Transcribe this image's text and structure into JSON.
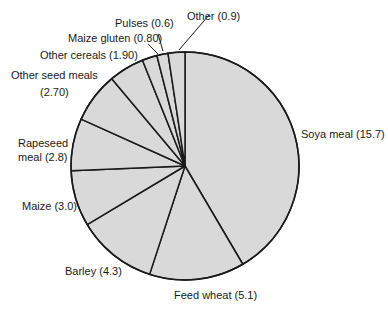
{
  "chart_data": {
    "type": "pie",
    "title": "",
    "start_angle_deg": 0,
    "direction": "clockwise",
    "fill_color": "#d9d9d9",
    "stroke_color": "#1a1a1a",
    "slices": [
      {
        "label": "Soya meal",
        "value": 15.7,
        "display": "Soya meal (15.7)"
      },
      {
        "label": "Feed wheat",
        "value": 5.1,
        "display": "Feed wheat (5.1)"
      },
      {
        "label": "Barley",
        "value": 4.3,
        "display": "Barley (4.3)"
      },
      {
        "label": "Maize",
        "value": 3.0,
        "display": "Maize (3.0)"
      },
      {
        "label": "Rapeseed meal",
        "value": 2.8,
        "display": "Rapeseed meal (2.8)"
      },
      {
        "label": "Other seed meals",
        "value": 2.7,
        "display": "Other seed meals (2.70)"
      },
      {
        "label": "Other cereals",
        "value": 1.9,
        "display": "Other cereals (1.90)"
      },
      {
        "label": "Maize gluten",
        "value": 0.8,
        "display": "Maize gluten (0.80)"
      },
      {
        "label": "Pulses",
        "value": 0.6,
        "display": "Pulses (0.6)"
      },
      {
        "label": "Other",
        "value": 0.9,
        "display": "Other (0.9)"
      }
    ]
  },
  "labels": {
    "soya": "Soya meal (15.7)",
    "feed_wheat": "Feed wheat (5.1)",
    "barley": "Barley (4.3)",
    "maize": "Maize (3.0)",
    "rapeseed_line1": "Rapeseed",
    "rapeseed_line2": "meal (2.8)",
    "other_seed_line1": "Other seed meals",
    "other_seed_line2": "(2.70)",
    "other_cereals": "Other cereals (1.90)",
    "maize_gluten": "Maize gluten (0.80)",
    "pulses": "Pulses (0.6)",
    "other": "Other (0.9)"
  }
}
